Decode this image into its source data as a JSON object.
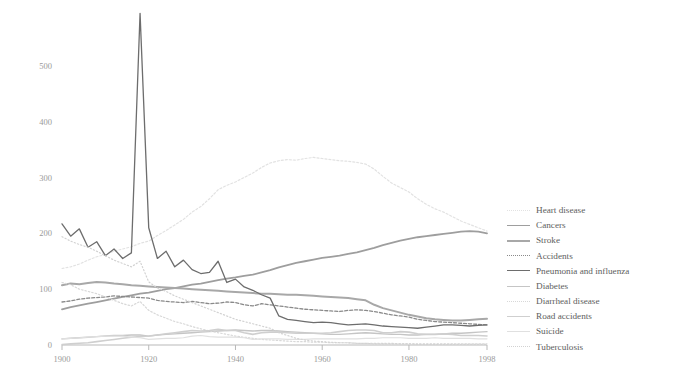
{
  "chart_data": {
    "type": "line",
    "title": "",
    "subtitle": "",
    "xlabel": "",
    "ylabel": "",
    "xlim": [
      1900,
      1998
    ],
    "ylim": [
      0,
      600
    ],
    "grid": false,
    "legend_position": "right",
    "x_ticks": [
      "1900",
      "1920",
      "1940",
      "1960",
      "1980",
      "1998"
    ],
    "x_tick_values": [
      1900,
      1920,
      1940,
      1960,
      1980,
      1998
    ],
    "y_ticks": [
      "0",
      "100",
      "200",
      "300",
      "400",
      "500"
    ],
    "y_tick_values": [
      0,
      100,
      200,
      300,
      400,
      500
    ],
    "x": [
      1900,
      1902,
      1904,
      1906,
      1908,
      1910,
      1912,
      1914,
      1916,
      1918,
      1920,
      1922,
      1924,
      1926,
      1928,
      1930,
      1932,
      1934,
      1936,
      1938,
      1940,
      1942,
      1944,
      1946,
      1948,
      1950,
      1952,
      1954,
      1956,
      1958,
      1960,
      1962,
      1964,
      1966,
      1968,
      1970,
      1972,
      1974,
      1976,
      1978,
      1980,
      1982,
      1984,
      1986,
      1988,
      1990,
      1992,
      1994,
      1996,
      1998
    ],
    "series": [
      {
        "name": "Heart disease",
        "color": "#e2e2e2",
        "dash": "2,2",
        "width": 1.2,
        "values": [
          137,
          140,
          145,
          152,
          158,
          162,
          168,
          172,
          176,
          182,
          186,
          196,
          205,
          215,
          225,
          238,
          248,
          262,
          278,
          286,
          292,
          300,
          308,
          318,
          326,
          330,
          332,
          331,
          334,
          336,
          334,
          332,
          330,
          329,
          327,
          324,
          315,
          302,
          290,
          282,
          274,
          262,
          252,
          244,
          238,
          230,
          222,
          216,
          210,
          204
        ]
      },
      {
        "name": "Cancers",
        "color": "#9e9e9e",
        "dash": "none",
        "width": 1.8,
        "values": [
          64,
          68,
          71,
          74,
          77,
          80,
          83,
          86,
          89,
          92,
          94,
          97,
          100,
          102,
          105,
          108,
          110,
          113,
          116,
          119,
          121,
          124,
          126,
          130,
          134,
          139,
          143,
          147,
          150,
          153,
          156,
          158,
          160,
          163,
          166,
          170,
          174,
          179,
          183,
          187,
          190,
          193,
          195,
          197,
          199,
          201,
          203,
          204,
          203,
          200
        ]
      },
      {
        "name": "Stroke",
        "color": "#a8a8a8",
        "dash": "none",
        "width": 2.0,
        "values": [
          107,
          110,
          109,
          111,
          113,
          112,
          110,
          109,
          107,
          106,
          105,
          104,
          103,
          102,
          101,
          100,
          99,
          98,
          97,
          96,
          95,
          94,
          93,
          92,
          92,
          91,
          90,
          90,
          89,
          88,
          87,
          86,
          85,
          84,
          82,
          80,
          72,
          66,
          62,
          58,
          54,
          51,
          48,
          46,
          45,
          44,
          44,
          45,
          46,
          47
        ]
      },
      {
        "name": "Accidents",
        "color": "#8a8a8a",
        "dash": "3,2",
        "width": 1.3,
        "values": [
          77,
          79,
          82,
          84,
          85,
          86,
          88,
          87,
          86,
          85,
          84,
          80,
          78,
          77,
          76,
          78,
          76,
          74,
          75,
          77,
          76,
          72,
          70,
          74,
          72,
          70,
          68,
          66,
          64,
          63,
          62,
          61,
          60,
          62,
          63,
          62,
          60,
          57,
          54,
          52,
          50,
          46,
          44,
          42,
          41,
          40,
          39,
          38,
          37,
          36
        ]
      },
      {
        "name": "Pneumonia and influenza",
        "color": "#6d6d6d",
        "dash": "none",
        "width": 1.3,
        "values": [
          217,
          195,
          208,
          175,
          185,
          160,
          172,
          155,
          165,
          594,
          210,
          155,
          168,
          140,
          152,
          135,
          128,
          130,
          150,
          112,
          118,
          104,
          98,
          90,
          84,
          52,
          46,
          44,
          42,
          40,
          41,
          40,
          38,
          36,
          37,
          38,
          36,
          34,
          33,
          32,
          31,
          30,
          32,
          34,
          36,
          36,
          35,
          34,
          35,
          36
        ]
      },
      {
        "name": "Diabetes",
        "color": "#c5c5c5",
        "dash": "none",
        "width": 1.4,
        "values": [
          11,
          12,
          13,
          14,
          15,
          16,
          17,
          17,
          18,
          18,
          16,
          18,
          19,
          20,
          21,
          22,
          23,
          24,
          25,
          26,
          27,
          26,
          25,
          26,
          26,
          25,
          24,
          23,
          22,
          21,
          20,
          19,
          19,
          20,
          21,
          22,
          21,
          20,
          19,
          19,
          18,
          18,
          19,
          19,
          20,
          21,
          21,
          22,
          23,
          24
        ]
      },
      {
        "name": "Diarrheal disease",
        "color": "#d8d8d8",
        "dash": "1.5,2",
        "width": 1.2,
        "values": [
          112,
          108,
          100,
          96,
          92,
          86,
          80,
          74,
          70,
          78,
          62,
          54,
          48,
          42,
          38,
          33,
          29,
          25,
          22,
          19,
          16,
          14,
          12,
          10,
          9,
          8,
          7,
          6,
          6,
          5,
          5,
          4,
          4,
          4,
          3,
          3,
          3,
          3,
          3,
          2,
          2,
          2,
          2,
          2,
          2,
          2,
          2,
          2,
          2,
          2
        ]
      },
      {
        "name": "Road accidents",
        "color": "#cfcfcf",
        "dash": "none",
        "width": 1.6,
        "values": [
          1,
          2,
          3,
          4,
          6,
          8,
          10,
          12,
          14,
          15,
          16,
          18,
          20,
          22,
          24,
          26,
          25,
          26,
          28,
          26,
          26,
          22,
          19,
          22,
          23,
          23,
          22,
          21,
          21,
          21,
          21,
          22,
          24,
          26,
          27,
          27,
          26,
          22,
          22,
          24,
          23,
          20,
          19,
          19,
          20,
          19,
          17,
          17,
          17,
          16
        ]
      },
      {
        "name": "Suicide",
        "color": "#e0e0e0",
        "dash": "none",
        "width": 1.2,
        "values": [
          11,
          12,
          13,
          14,
          15,
          16,
          16,
          16,
          14,
          13,
          10,
          11,
          12,
          12,
          13,
          16,
          17,
          15,
          14,
          14,
          14,
          13,
          10,
          11,
          11,
          11,
          10,
          10,
          10,
          11,
          11,
          11,
          11,
          11,
          11,
          12,
          12,
          13,
          13,
          13,
          12,
          12,
          12,
          13,
          12,
          12,
          12,
          12,
          11,
          11
        ]
      },
      {
        "name": "Tuberculosis",
        "color": "#d2d2d2",
        "dash": "1.2,2.2",
        "width": 1.2,
        "values": [
          194,
          186,
          180,
          175,
          168,
          160,
          152,
          146,
          140,
          150,
          113,
          102,
          96,
          88,
          82,
          76,
          70,
          64,
          58,
          52,
          46,
          42,
          38,
          34,
          30,
          22,
          17,
          12,
          9,
          7,
          6,
          5,
          4,
          4,
          3,
          3,
          2,
          2,
          2,
          2,
          2,
          1,
          1,
          1,
          1,
          1,
          1,
          1,
          1,
          1
        ]
      }
    ]
  },
  "legend": {
    "items": [
      {
        "label": "Heart disease"
      },
      {
        "label": "Cancers"
      },
      {
        "label": "Stroke"
      },
      {
        "label": "Accidents"
      },
      {
        "label": "Pneumonia and influenza"
      },
      {
        "label": "Diabetes"
      },
      {
        "label": "Diarrheal disease"
      },
      {
        "label": "Road accidents"
      },
      {
        "label": "Suicide"
      },
      {
        "label": "Tuberculosis"
      }
    ]
  }
}
